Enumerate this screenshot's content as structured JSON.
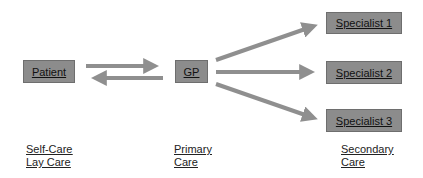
{
  "nodes": {
    "patient": "Patient",
    "gp": "GP",
    "specialist1": "Specialist 1",
    "specialist2": "Specialist 2",
    "specialist3": "Specialist 3"
  },
  "levels": {
    "self_care": [
      "Self-Care",
      "Lay Care"
    ],
    "primary": [
      "Primary",
      "Care"
    ],
    "secondary": [
      "Secondary",
      "Care"
    ]
  },
  "colors": {
    "box": "#8c8c8c",
    "arrow": "#8f8f8f"
  }
}
